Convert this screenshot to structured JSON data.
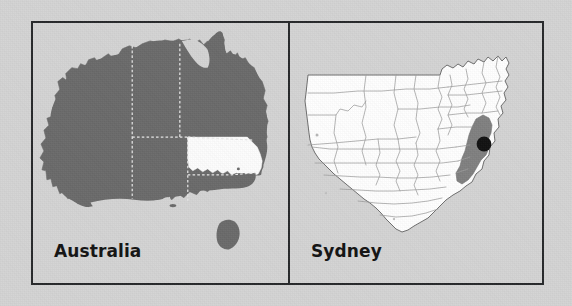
{
  "figure": {
    "width": 572,
    "height": 306,
    "background_color": "#d4d4d4",
    "frame_border_color": "#26282a",
    "type": "locator-map-pair"
  },
  "panels": [
    {
      "id": "australia",
      "label": "Australia",
      "subject": "Australia with New South Wales highlighted",
      "land_fill": "#6a6a6a",
      "highlight_fill": "#ffffff",
      "highlight_region": "New South Wales",
      "internal_border_color": "#e8e8e8",
      "internal_border_style": "dashed",
      "features": [
        "Western Australia",
        "Northern Territory",
        "South Australia",
        "Queensland",
        "New South Wales",
        "Victoria",
        "Tasmania"
      ]
    },
    {
      "id": "sydney",
      "label": "Sydney",
      "subject": "New South Wales local government areas with Sydney highlighted",
      "land_fill": "#ffffff",
      "boundary_color": "#9a9a9a",
      "outline_color": "#6e6e6e",
      "highlight_fill": "#808080",
      "highlight_region": "Sydney metropolitan area",
      "marker": {
        "name": "Sydney",
        "shape": "filled-circle",
        "color": "#111111"
      }
    }
  ]
}
